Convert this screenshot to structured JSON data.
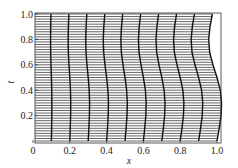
{
  "chart_data": {
    "type": "line",
    "title": "",
    "xlabel": "x",
    "ylabel": "t",
    "xlim": [
      0,
      1.0
    ],
    "ylim": [
      0,
      1.02
    ],
    "grid": false,
    "legend": null,
    "x_ticks": [
      "0",
      "0.2",
      "0.4",
      "0.6",
      "0.8",
      "1.0"
    ],
    "y_ticks": [
      "0.2",
      "0.4",
      "0.6",
      "0.8",
      "1.0"
    ],
    "horizontal_lines": {
      "count": 50,
      "t_start": 0.0,
      "t_end": 1.0
    },
    "vertical_curves": {
      "x0": [
        0.1,
        0.2,
        0.3,
        0.4,
        0.5,
        0.6,
        0.7,
        0.8,
        0.9,
        1.0
      ],
      "t_samples": [
        0.0,
        0.1,
        0.2,
        0.3,
        0.4,
        0.5,
        0.6,
        0.7,
        0.8,
        0.9,
        1.0
      ],
      "displacement_per_unit_x0": [
        0.0,
        0.012,
        0.022,
        0.025,
        0.018,
        0.0,
        -0.022,
        -0.04,
        -0.045,
        -0.038,
        -0.025
      ]
    },
    "colors": {
      "mesh": "#555555",
      "curves": "#111111",
      "frame": "#333333",
      "background": "#ffffff"
    }
  }
}
